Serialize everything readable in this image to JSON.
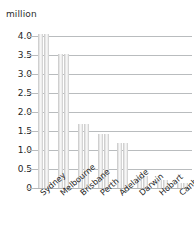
{
  "chart_data": {
    "type": "bar",
    "title": "",
    "subtitle": "",
    "xlabel": "",
    "ylabel": "million",
    "unit_label": "million",
    "categories": [
      "Sydney",
      "Melbourne",
      "Brisbane",
      "Perth",
      "Adelaide",
      "Darwin",
      "Hobart",
      "Canberra"
    ],
    "values": [
      4.05,
      3.52,
      1.67,
      1.42,
      1.18,
      0.32,
      0.21,
      0.13
    ],
    "series": [
      {
        "name": "Population",
        "values": [
          4.05,
          3.52,
          1.67,
          1.42,
          1.18,
          0.32,
          0.21,
          0.13
        ]
      },
      {
        "name": "Population",
        "values": [
          4.05,
          3.52,
          1.67,
          1.42,
          1.18,
          0.32,
          0.21,
          0.13
        ]
      }
    ],
    "bars_per_category": 2,
    "ylim": [
      0,
      4.25
    ],
    "yticks": [
      0,
      0.5,
      1.0,
      1.5,
      2.0,
      2.5,
      3.0,
      3.5,
      4.0
    ],
    "ytick_labels": [
      "0",
      "0.5",
      "1.0",
      "1.5",
      "2.0",
      "2.5",
      "3.0",
      "3.5",
      "4.0"
    ],
    "grid": true,
    "grid_axis": "y",
    "legend": false,
    "legend_position": "none",
    "xtick_rotation": -41,
    "colors": {
      "bar_fill": "#f2f2f2",
      "bar_edge": "#cfcfcf",
      "gridline": "#b9bcbe",
      "text": "#1f1f1f"
    }
  }
}
